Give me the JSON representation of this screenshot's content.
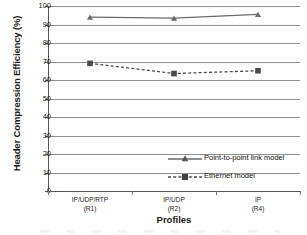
{
  "chart_data": {
    "type": "line",
    "title": "",
    "xlabel": "Profiles",
    "ylabel": "Header Compression Efficiency (%)",
    "categories": [
      "IP/UDP/RTP\n(R1)",
      "IP/UDP\n(R2)",
      "IP\n(R4)"
    ],
    "category_labels": [
      {
        "main": "IP/UDP/RTP",
        "sub": "(R1)"
      },
      {
        "main": "IP/UDP",
        "sub": "(R2)"
      },
      {
        "main": "IP",
        "sub": "(R4)"
      }
    ],
    "ylim": [
      0,
      100
    ],
    "ytick_step": 10,
    "yticks": [
      100,
      90,
      80,
      70,
      60,
      50,
      40,
      30,
      20,
      10,
      0
    ],
    "grid": true,
    "grid_axis": "y",
    "legend_position": "inside-lower-right",
    "series": [
      {
        "name": "Point-to-point link model",
        "values": [
          94,
          93.5,
          95.5
        ],
        "line_style": "solid",
        "marker": "triangle",
        "color": "#6b6b6b"
      },
      {
        "name": "Ethernet model",
        "values": [
          69,
          63.5,
          65
        ],
        "line_style": "dashed",
        "marker": "square",
        "color": "#4a4a4a"
      }
    ]
  },
  "axis": {
    "y_title": "Header Compression Efficiency (%)",
    "x_title": "Profiles"
  },
  "legend": {
    "items": [
      {
        "label": "Point-to-point link model",
        "marker": "triangle-marker",
        "line": "solid"
      },
      {
        "label": "Ethernet model",
        "marker": "square-marker",
        "line": "dashed"
      }
    ]
  },
  "colors": {
    "series_point_to_point": "#6b6b6b",
    "series_ethernet": "#4a4a4a",
    "grid": "#8e8e8e",
    "axis": "#555555",
    "text": "#1a1a1a",
    "background": "#ffffff"
  }
}
